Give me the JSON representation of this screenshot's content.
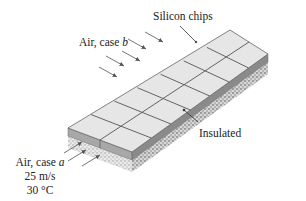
{
  "diagram": {
    "labels": {
      "chips": "Silicon chips",
      "insulated": "Insulated",
      "case_b_prefix": "Air, case ",
      "case_b_var": "b",
      "case_a_prefix": "Air, case ",
      "case_a_var": "a",
      "velocity": "25 m/s",
      "temperature": "30 °C"
    },
    "grid": {
      "columns": 2,
      "rows": 7
    },
    "colors": {
      "chip_top": "#e4e4e4",
      "chip_grid": "#555555",
      "chip_side_front": "#9a9a9a",
      "chip_side_right": "#7d7d7d",
      "insulation": "#cfcfcf",
      "arrow": "#666666",
      "text": "#222222"
    }
  }
}
